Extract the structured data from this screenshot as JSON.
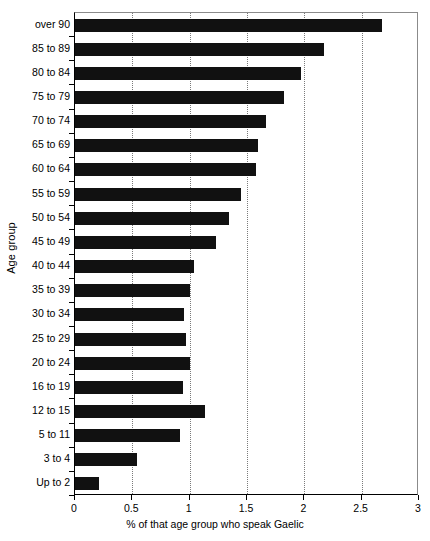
{
  "chart_data": {
    "type": "bar",
    "orientation": "horizontal",
    "title": "",
    "xlabel": "% of that age group who speak Gaelic",
    "ylabel": "Age group",
    "xlim": [
      0,
      3
    ],
    "xticks": [
      "0",
      "0.5",
      "1",
      "1.5",
      "2",
      "2.5",
      "3"
    ],
    "xtick_values": [
      0,
      0.5,
      1,
      1.5,
      2,
      2.5,
      3
    ],
    "grid": "vertical dotted gridlines at each x tick",
    "legend": "none",
    "bar_color": "#111111",
    "categories": [
      "over 90",
      "85 to 89",
      "80 to 84",
      "75 to 79",
      "70 to 74",
      "65 to 69",
      "60 to 64",
      "55 to 59",
      "50 to 54",
      "45 to 49",
      "40 to 44",
      "35 to 39",
      "30 to 34",
      "25 to 29",
      "20 to 24",
      "16 to 19",
      "12 to 15",
      "5 to 11",
      "3 to 4",
      "Up to 2"
    ],
    "values": [
      2.68,
      2.17,
      1.97,
      1.82,
      1.67,
      1.6,
      1.58,
      1.45,
      1.34,
      1.23,
      1.04,
      1.0,
      0.95,
      0.97,
      1.0,
      0.94,
      1.13,
      0.92,
      0.54,
      0.21
    ]
  }
}
